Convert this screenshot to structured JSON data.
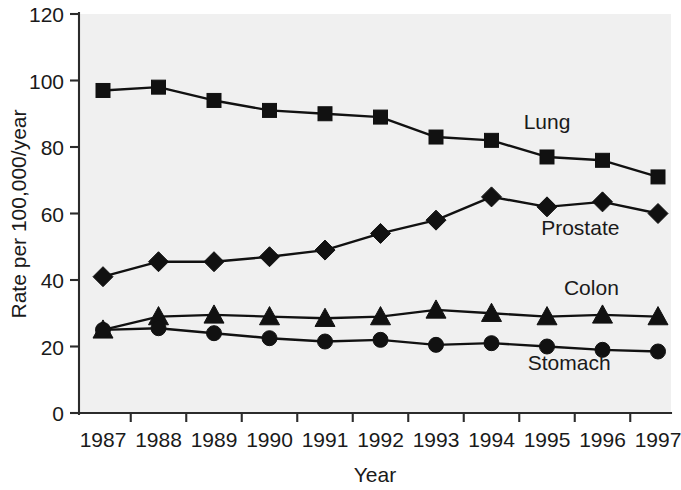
{
  "chart_data": {
    "type": "line",
    "title": "",
    "xlabel": "Year",
    "ylabel": "Rate per 100,000/year",
    "categories": [
      "1987",
      "1988",
      "1989",
      "1990",
      "1991",
      "1992",
      "1993",
      "1994",
      "1995",
      "1996",
      "1997"
    ],
    "x": [
      1987,
      1988,
      1989,
      1990,
      1991,
      1992,
      1993,
      1994,
      1995,
      1996,
      1997
    ],
    "ylim": [
      0,
      120
    ],
    "yticks": [
      0,
      20,
      40,
      60,
      80,
      100,
      120
    ],
    "ytick_labels": [
      "0",
      "20",
      "40",
      "60",
      "80",
      "100",
      "120"
    ],
    "xlim": [
      1986.5,
      1997.5
    ],
    "grid": false,
    "legend_position": "inline-right",
    "series": [
      {
        "name": "Lung",
        "marker": "square",
        "color": "#111111",
        "label_text": "Lung",
        "values": [
          97,
          98,
          94,
          91,
          90,
          89,
          83,
          82,
          77,
          76,
          71
        ]
      },
      {
        "name": "Prostate",
        "marker": "diamond",
        "color": "#111111",
        "label_text": "Prostate",
        "values": [
          41,
          45.5,
          45.5,
          47,
          49,
          54,
          58,
          65,
          62,
          63.5,
          60
        ]
      },
      {
        "name": "Colon",
        "marker": "triangle",
        "color": "#111111",
        "label_text": "Colon",
        "values": [
          25,
          29,
          29.5,
          29,
          28.5,
          29,
          31,
          30,
          29,
          29.5,
          29
        ]
      },
      {
        "name": "Stomach",
        "marker": "circle",
        "color": "#111111",
        "label_text": "Stomach",
        "values": [
          25,
          25.5,
          24,
          22.5,
          21.5,
          22,
          20.5,
          21,
          20,
          19,
          18.5
        ]
      }
    ],
    "annotations": [
      {
        "text": "Lung",
        "x": 1995.0,
        "y": 85.5
      },
      {
        "text": "Prostate",
        "x": 1995.6,
        "y": 53.5
      },
      {
        "text": "Colon",
        "x": 1995.8,
        "y": 35.5
      },
      {
        "text": "Stomach",
        "x": 1995.4,
        "y": 13.0
      }
    ]
  },
  "axes": {
    "y_title": "Rate per 100,000/year",
    "x_title": "Year"
  }
}
